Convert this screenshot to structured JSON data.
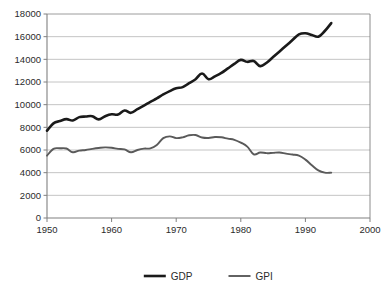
{
  "chart_data": {
    "type": "line",
    "title": "",
    "xlabel": "",
    "ylabel": "",
    "xlim": [
      1950,
      2000
    ],
    "ylim": [
      0,
      18000
    ],
    "x_ticks": [
      "1950",
      "1960",
      "1970",
      "1980",
      "1990",
      "2000"
    ],
    "x_tick_values": [
      1950,
      1960,
      1970,
      1980,
      1990,
      2000
    ],
    "y_ticks": [
      "0",
      "2000",
      "4000",
      "6000",
      "8000",
      "10000",
      "12000",
      "14000",
      "16000",
      "18000"
    ],
    "y_tick_values": [
      0,
      2000,
      4000,
      6000,
      8000,
      10000,
      12000,
      14000,
      16000,
      18000
    ],
    "grid": true,
    "grid_axis": "y",
    "legend_position": "bottom",
    "x": [
      1950,
      1951,
      1952,
      1953,
      1954,
      1955,
      1956,
      1957,
      1958,
      1959,
      1960,
      1961,
      1962,
      1963,
      1964,
      1965,
      1966,
      1967,
      1968,
      1969,
      1970,
      1971,
      1972,
      1973,
      1974,
      1975,
      1976,
      1977,
      1978,
      1979,
      1980,
      1981,
      1982,
      1983,
      1984,
      1985,
      1986,
      1987,
      1988,
      1989,
      1990,
      1991,
      1992,
      1993,
      1994
    ],
    "series": [
      {
        "name": "GDP",
        "color": "#1a1a1a",
        "width": 2.6,
        "values": [
          7700,
          8350,
          8550,
          8720,
          8600,
          8900,
          8950,
          8980,
          8700,
          8980,
          9150,
          9130,
          9480,
          9280,
          9600,
          9920,
          10250,
          10550,
          10900,
          11200,
          11450,
          11550,
          11900,
          12250,
          12750,
          12250,
          12500,
          12800,
          13200,
          13600,
          13950,
          13780,
          13850,
          13400,
          13700,
          14200,
          14700,
          15200,
          15700,
          16200,
          16300,
          16150,
          16000,
          16500,
          17200
        ]
      },
      {
        "name": "GPI",
        "color": "#5a5a5a",
        "width": 1.9,
        "values": [
          5500,
          6100,
          6150,
          6130,
          5800,
          5950,
          6000,
          6100,
          6180,
          6230,
          6200,
          6100,
          6050,
          5800,
          6000,
          6120,
          6150,
          6450,
          7050,
          7200,
          7050,
          7120,
          7300,
          7320,
          7100,
          7060,
          7150,
          7120,
          7000,
          6900,
          6650,
          6300,
          5620,
          5780,
          5720,
          5750,
          5780,
          5680,
          5600,
          5500,
          5150,
          4650,
          4200,
          4000,
          4000
        ]
      }
    ]
  },
  "legend": {
    "items": [
      {
        "label": "GDP",
        "color": "#1a1a1a"
      },
      {
        "label": "GPI",
        "color": "#5a5a5a"
      }
    ]
  },
  "axes": {
    "axis_color": "#808080",
    "grid_color": "#b5b5b5",
    "background": "#ffffff"
  }
}
